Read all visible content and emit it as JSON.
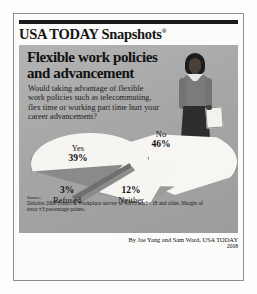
{
  "brand": {
    "name": "USA TODAY Snapshots",
    "registered_mark": "®"
  },
  "headline": {
    "line1": "Flexible work policies",
    "line2": "and advancement",
    "full": "Flexible work policies and advancement"
  },
  "question": "Would taking advantage of flexible work policies such as telecommuting, flex time or working part time hurt your career advancement?",
  "illustration": {
    "name": "businesswoman-with-briefcase"
  },
  "source": {
    "label": "Source:",
    "text": "Deloitte 2008 Ethics & Workplace survey of 4,035 adults 18 and older. Margin of error ±3 percentage points."
  },
  "byline": {
    "credit": "By Jae Yang and Sam Ward, USA TODAY",
    "year": "2008"
  },
  "labels": {
    "yes_name": "Yes",
    "yes_pct": "39%",
    "no_name": "No",
    "no_pct": "46%",
    "neither_name": "Neither",
    "neither_pct": "12%",
    "refused_name": "Refused",
    "refused_pct": "3%"
  },
  "colors": {
    "panel_gray": "#ababab",
    "pie_light": "#f6f5f1",
    "pie_shadow": "#8a8a8a",
    "text_dark": "#111111",
    "rule_black": "#1a1a1a"
  },
  "chart_data": {
    "type": "pie",
    "title": "Flexible work policies and advancement",
    "subtitle": "Would taking advantage of flexible work policies such as telecommuting, flex time or working part time hurt your career advancement?",
    "categories": [
      "No",
      "Yes",
      "Neither",
      "Refused"
    ],
    "values": [
      46,
      39,
      12,
      3
    ],
    "labels": [
      "46%",
      "39%",
      "12%",
      "3%"
    ],
    "unit": "percent",
    "total": 100,
    "exploded": true,
    "three_d": true,
    "legend": "none",
    "data_labels": true,
    "slices": [
      {
        "name": "No",
        "value": 46,
        "label": "46%"
      },
      {
        "name": "Yes",
        "value": 39,
        "label": "39%"
      },
      {
        "name": "Neither",
        "value": 12,
        "label": "12%"
      },
      {
        "name": "Refused",
        "value": 3,
        "label": "3%"
      }
    ]
  }
}
